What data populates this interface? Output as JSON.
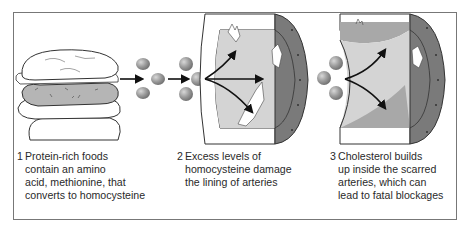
{
  "figure": {
    "steps": [
      {
        "number": "1",
        "lines": [
          "Protein-rich foods",
          "contain an amino",
          "acid, methionine, that",
          "converts to homocysteine"
        ],
        "illustration": "burger-icon"
      },
      {
        "number": "2",
        "lines": [
          "Excess levels of",
          "homocysteine damage",
          "the lining of arteries"
        ],
        "illustration": "damaged-artery-icon"
      },
      {
        "number": "3",
        "lines": [
          "Cholesterol builds",
          "up inside the scarred",
          "arteries, which can",
          "lead to fatal blockages"
        ],
        "illustration": "blocked-artery-icon"
      }
    ],
    "colors": {
      "border": "#777777",
      "molecule": "#9a9a9a",
      "artery_lumen": "#d4d4d4",
      "artery_wall": "#7a7a7a",
      "plaque": "#a8a8a8",
      "arrow": "#111111",
      "text": "#2a2a2a"
    }
  }
}
